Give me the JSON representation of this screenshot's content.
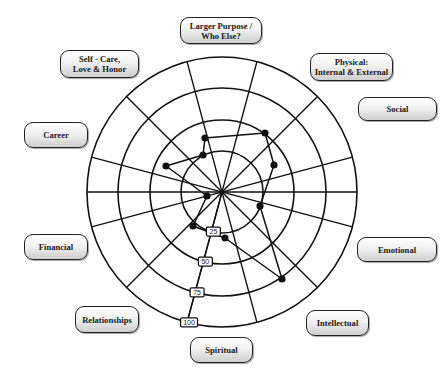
{
  "chart_data": {
    "type": "radar-wheel",
    "title": "",
    "center": [
      222,
      192
    ],
    "ring_radii": [
      41,
      72,
      104,
      135
    ],
    "scale": {
      "ticks": [
        25,
        50,
        75,
        100
      ],
      "labels": [
        "25",
        "50",
        "75",
        "100"
      ],
      "max": 100,
      "axis_angle_deg": 255
    },
    "spoke_angles_deg": [
      15,
      45,
      75,
      105,
      135,
      165,
      195,
      225,
      255,
      285,
      315,
      345
    ],
    "categories": [
      "Larger Purpose / Who Else?",
      "Physical: Internal & External",
      "Social",
      "Emotional",
      "Intellectual",
      "Spiritual",
      "Relationships",
      "Financial",
      "Career",
      "Self - Care, Love & Honor"
    ],
    "points": [
      {
        "x": 205,
        "y": 138
      },
      {
        "x": 265,
        "y": 133
      },
      {
        "x": 274,
        "y": 165
      },
      {
        "x": 260,
        "y": 206
      },
      {
        "x": 282,
        "y": 279
      },
      {
        "x": 225,
        "y": 238
      },
      {
        "x": 193,
        "y": 226
      },
      {
        "x": 207,
        "y": 196
      },
      {
        "x": 166,
        "y": 166
      },
      {
        "x": 203,
        "y": 155
      }
    ],
    "grid": true,
    "legend": "none"
  },
  "labels": [
    {
      "id": "larger-purpose",
      "text": "Larger Purpose /\nWho Else?",
      "x": 180,
      "y": 17,
      "w": 82,
      "h": 27
    },
    {
      "id": "physical",
      "text": "Physical:\nInternal & External",
      "x": 310,
      "y": 53,
      "w": 83,
      "h": 28
    },
    {
      "id": "social",
      "text": "Social",
      "x": 358,
      "y": 97,
      "w": 79,
      "h": 24
    },
    {
      "id": "emotional",
      "text": "Emotional",
      "x": 357,
      "y": 237,
      "w": 80,
      "h": 25
    },
    {
      "id": "intellectual",
      "text": "Intellectual",
      "x": 306,
      "y": 310,
      "w": 63,
      "h": 26
    },
    {
      "id": "spiritual",
      "text": "Spiritual",
      "x": 190,
      "y": 337,
      "w": 63,
      "h": 26
    },
    {
      "id": "relationships",
      "text": "Relationships",
      "x": 75,
      "y": 306,
      "w": 64,
      "h": 27
    },
    {
      "id": "financial",
      "text": "Financial",
      "x": 24,
      "y": 234,
      "w": 64,
      "h": 26
    },
    {
      "id": "career",
      "text": "Career",
      "x": 24,
      "y": 122,
      "w": 64,
      "h": 26
    },
    {
      "id": "self-care",
      "text": "Self - Care,\nLove & Honor",
      "x": 60,
      "y": 50,
      "w": 79,
      "h": 28
    }
  ]
}
